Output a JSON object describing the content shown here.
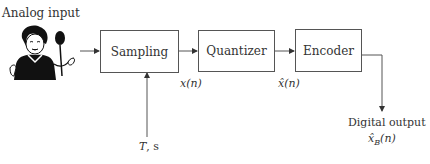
{
  "diagram": {
    "input_label": "Analog input",
    "input_icon": "woman-singing-into-microphone",
    "blocks": [
      {
        "id": "sampling",
        "label": "Sampling"
      },
      {
        "id": "quantizer",
        "label": "Quantizer"
      },
      {
        "id": "encoder",
        "label": "Encoder"
      }
    ],
    "signals": {
      "sampled": {
        "symbol": "x",
        "arg": "(n)"
      },
      "quantized": {
        "symbol": "x̂",
        "arg": "(n)"
      },
      "output": {
        "symbol": "x̂",
        "sub": "B",
        "arg": "(n)"
      }
    },
    "sampling_period": {
      "symbol": "T",
      "rest": ", s"
    },
    "output_label": "Digital output",
    "colors": {
      "line": "#555555",
      "text": "#333333",
      "background": "#ffffff"
    }
  }
}
